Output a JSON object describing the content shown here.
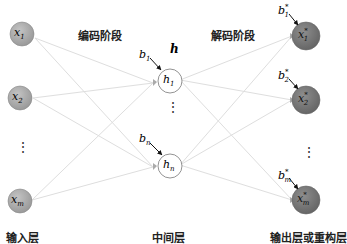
{
  "stage_labels": {
    "encode": "编码阶段",
    "decode": "解码阶段"
  },
  "layer_labels": {
    "input": "输入层",
    "hidden": "中间层",
    "output": "输出层或重构层"
  },
  "hidden_label": "h",
  "input_nodes": [
    {
      "var": "x",
      "sub": "1"
    },
    {
      "var": "x",
      "sub": "2"
    },
    {
      "var": "x",
      "sub": "m"
    }
  ],
  "hidden_nodes": [
    {
      "var": "h",
      "sub": "1",
      "bias": "b",
      "bias_sub": "1"
    },
    {
      "var": "h",
      "sub": "n",
      "bias": "b",
      "bias_sub": "n"
    }
  ],
  "output_nodes": [
    {
      "var": "x",
      "sup": "*",
      "sub": "1",
      "bias": "b",
      "bias_sup": "*",
      "bias_sub": "1"
    },
    {
      "var": "x",
      "sup": "*",
      "sub": "2",
      "bias": "b",
      "bias_sup": "*",
      "bias_sub": "2"
    },
    {
      "var": "x",
      "sup": "*",
      "sub": "m",
      "bias": "b",
      "bias_sup": "*",
      "bias_sub": "m"
    }
  ],
  "ellipsis": "⋮",
  "colors": {
    "input_fill": "#b0b0b0",
    "output_fill": "#7e7e7e",
    "hidden_fill": "#ffffff",
    "edge": "#dddddd",
    "arrow": "#111111"
  }
}
